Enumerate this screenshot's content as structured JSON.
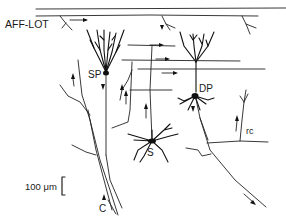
{
  "diagram": {
    "type": "neuron-circuit-diagram",
    "labels": {
      "aff_lot": "AFF-LOT",
      "sp": "SP",
      "dp": "DP",
      "s": "S",
      "rc": "rc",
      "c": "C",
      "scale": "100 μm"
    },
    "cells": [
      {
        "id": "SP",
        "name": "superficial pyramidal cell"
      },
      {
        "id": "DP",
        "name": "deep pyramidal cell"
      },
      {
        "id": "S",
        "name": "stellate / multipolar cell"
      }
    ],
    "fibers": [
      {
        "id": "AFF-LOT",
        "name": "afferent lateral olfactory tract fibers"
      },
      {
        "id": "rc",
        "name": "recurrent collateral"
      },
      {
        "id": "C",
        "name": "corticofugal axon"
      }
    ],
    "colors": {
      "ink": "#111111",
      "background": "#ffffff"
    }
  }
}
